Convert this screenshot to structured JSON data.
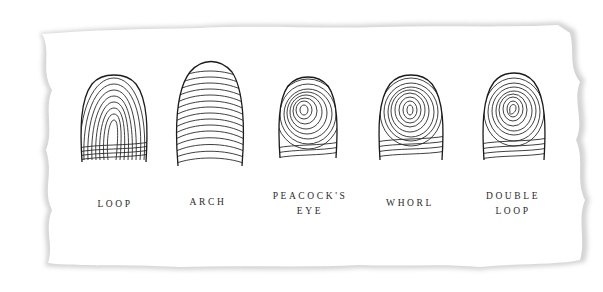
{
  "figure": {
    "colors": {
      "paper": "#ffffff",
      "edge_shadow": "#cfcfcf",
      "ink": "#2a2a2a"
    },
    "patterns": [
      {
        "name": "loop",
        "label_line1": "LOOP",
        "label_line2": ""
      },
      {
        "name": "arch",
        "label_line1": "ARCH",
        "label_line2": ""
      },
      {
        "name": "peacocks-eye",
        "label_line1": "PEACOCK'S",
        "label_line2": "EYE"
      },
      {
        "name": "whorl",
        "label_line1": "WHORL",
        "label_line2": ""
      },
      {
        "name": "double-loop",
        "label_line1": "DOUBLE",
        "label_line2": "LOOP"
      }
    ]
  }
}
